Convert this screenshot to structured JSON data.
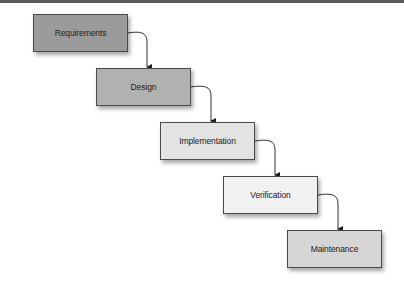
{
  "diagram": {
    "type": "waterfall-model",
    "stages": [
      {
        "label": "Requirements",
        "fill": "#9b9b9b",
        "x": 33,
        "y": 14
      },
      {
        "label": "Design",
        "fill": "#b1b1b1",
        "x": 96,
        "y": 68
      },
      {
        "label": "Implementation",
        "fill": "#e3e3e3",
        "x": 160,
        "y": 122
      },
      {
        "label": "Verification",
        "fill": "#f1f1f1",
        "x": 223,
        "y": 176
      },
      {
        "label": "Maintenance",
        "fill": "#d5d5d5",
        "x": 287,
        "y": 230
      }
    ],
    "connectors": [
      {
        "from": "Requirements",
        "to": "Design"
      },
      {
        "from": "Design",
        "to": "Implementation"
      },
      {
        "from": "Implementation",
        "to": "Verification"
      },
      {
        "from": "Verification",
        "to": "Maintenance"
      }
    ],
    "top_bar_color": "#5a5a5a",
    "border_color": "#4a4a4a"
  }
}
